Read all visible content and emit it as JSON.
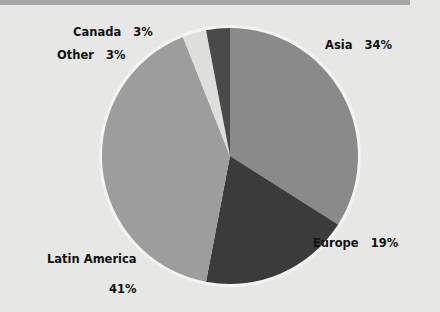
{
  "header": {
    "title": "GLOBAL MARKET",
    "bar_color": "#a6a6a6",
    "text_color": "#ffffff"
  },
  "canvas": {
    "width": 440,
    "height": 312,
    "background": "#e7e7e5"
  },
  "chart_data": {
    "type": "pie",
    "title": "GLOBAL MARKET",
    "xlabel": "",
    "ylabel": "",
    "legend_position": "none",
    "grid": false,
    "labels_on_slices": false,
    "units": "percent",
    "center": {
      "x": 230,
      "y": 156
    },
    "radius": 128,
    "start_angle_deg": 0,
    "direction": "clockwise",
    "categories": [
      "Asia",
      "Europe",
      "Latin America",
      "Other",
      "Canada"
    ],
    "values": [
      34,
      19,
      41,
      3,
      3
    ],
    "colors": [
      "#8a8a8a",
      "#3b3b3b",
      "#9d9d9d",
      "#dededc",
      "#4a4a4a"
    ],
    "slices": [
      {
        "name": "Asia",
        "value": 34,
        "display": "34%",
        "color": "#8a8a8a"
      },
      {
        "name": "Europe",
        "value": 19,
        "display": "19%",
        "color": "#3b3b3b"
      },
      {
        "name": "Latin America",
        "value": 41,
        "display": "41%",
        "color": "#9d9d9d"
      },
      {
        "name": "Other",
        "value": 3,
        "display": "3%",
        "color": "#dededc"
      },
      {
        "name": "Canada",
        "value": 3,
        "display": "3%",
        "color": "#4a4a4a"
      }
    ]
  },
  "labels": {
    "canada": "Canada   3%",
    "other": "Other   3%",
    "asia": "Asia   34%",
    "europe": "Europe   19%",
    "latin_name": "Latin America",
    "latin_percent": "41%"
  }
}
